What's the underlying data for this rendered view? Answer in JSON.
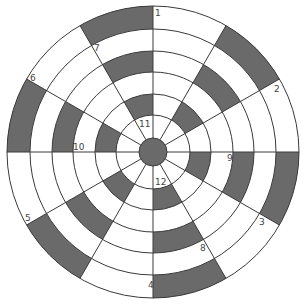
{
  "diagram": {
    "center": [
      153,
      152
    ],
    "ring_radii": [
      14,
      37,
      58,
      80,
      101,
      123,
      146
    ],
    "sector_count": 12,
    "colors": {
      "dark": "#6a6a6a",
      "light": "#ffffff",
      "line": "#3a3a3a",
      "hub": "#6a6a6a"
    },
    "shaded": [
      {
        "sector": 1,
        "rings": [
          2,
          4,
          6
        ]
      },
      {
        "sector": 3,
        "rings": [
          2,
          4,
          6
        ]
      },
      {
        "sector": 5,
        "rings": [
          2,
          4,
          6
        ]
      },
      {
        "sector": 7,
        "rings": [
          2,
          4,
          6
        ]
      },
      {
        "sector": 9,
        "rings": [
          2,
          4,
          6
        ]
      },
      {
        "sector": 11,
        "rings": [
          2,
          4,
          6
        ]
      }
    ],
    "labels": [
      {
        "text": "1",
        "x": 155,
        "y": 16
      },
      {
        "text": "2",
        "x": 274,
        "y": 92
      },
      {
        "text": "3",
        "x": 259,
        "y": 225
      },
      {
        "text": "4",
        "x": 148,
        "y": 288
      },
      {
        "text": "5",
        "x": 25,
        "y": 221
      },
      {
        "text": "6",
        "x": 30,
        "y": 81
      },
      {
        "text": "7",
        "x": 94,
        "y": 51
      },
      {
        "text": "8",
        "x": 200,
        "y": 251
      },
      {
        "text": "9",
        "x": 227,
        "y": 161
      },
      {
        "text": "10",
        "x": 73,
        "y": 150
      },
      {
        "text": "11",
        "x": 139,
        "y": 127
      },
      {
        "text": "12",
        "x": 155,
        "y": 185
      }
    ]
  }
}
